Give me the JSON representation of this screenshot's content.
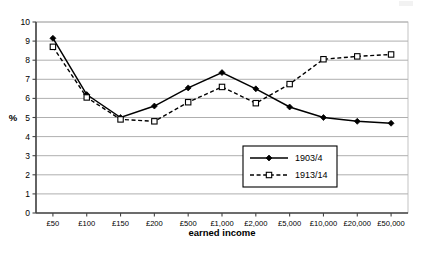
{
  "chart_data": {
    "type": "line",
    "title": "",
    "xlabel": "earned income",
    "ylabel": "%",
    "categories": [
      "£50",
      "£100",
      "£150",
      "£200",
      "£500",
      "£1,000",
      "£2,000",
      "£5,000",
      "£10,000",
      "£20,000",
      "£50,000"
    ],
    "ylim": [
      0,
      10
    ],
    "ytick_step": 1,
    "yticks": [
      "0",
      "1",
      "2",
      "3",
      "4",
      "5",
      "6",
      "7",
      "8",
      "9",
      "10"
    ],
    "grid": true,
    "grid_axis": "y",
    "legend_position": "inside-lower-right",
    "series": [
      {
        "name": "1903/4",
        "marker": "filled-diamond",
        "line_style": "solid",
        "color": "#000000",
        "values": [
          9.15,
          6.2,
          5.0,
          5.6,
          6.55,
          7.35,
          6.5,
          5.55,
          5.0,
          4.8,
          4.7
        ]
      },
      {
        "name": "1913/14",
        "marker": "open-square",
        "line_style": "dashed",
        "color": "#000000",
        "values": [
          8.7,
          6.05,
          4.9,
          4.8,
          5.8,
          6.6,
          5.75,
          6.75,
          8.05,
          8.2,
          8.3
        ]
      }
    ]
  },
  "legend": {
    "entries": [
      {
        "label": "1903/4"
      },
      {
        "label": "1913/14"
      }
    ]
  }
}
